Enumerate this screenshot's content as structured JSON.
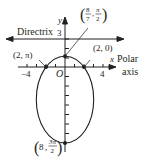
{
  "figure": {
    "type": "polar conic (ellipse)",
    "colors": {
      "ink": "#231f20",
      "background": "#ffffff"
    },
    "labels": {
      "directrix": "Directrix",
      "y_axis": "y",
      "x_axis": "x",
      "polar_axis_line1": "Polar",
      "polar_axis_line2": "axis",
      "origin": "O",
      "tick_y3": "3",
      "tick_xneg4": "−4",
      "tick_x4": "4"
    },
    "points": [
      {
        "id": "top",
        "r_num": "8",
        "r_den": "7",
        "theta_num": "π",
        "theta_den": "2",
        "label_open": "(",
        "label_close": ")"
      },
      {
        "id": "right",
        "label": "(2, 0)"
      },
      {
        "id": "left",
        "label": "(2, π)"
      },
      {
        "id": "bottom",
        "r": "8",
        "theta_num": "3π",
        "theta_den": "2",
        "label_open": "(",
        "label_close": ")"
      }
    ]
  }
}
